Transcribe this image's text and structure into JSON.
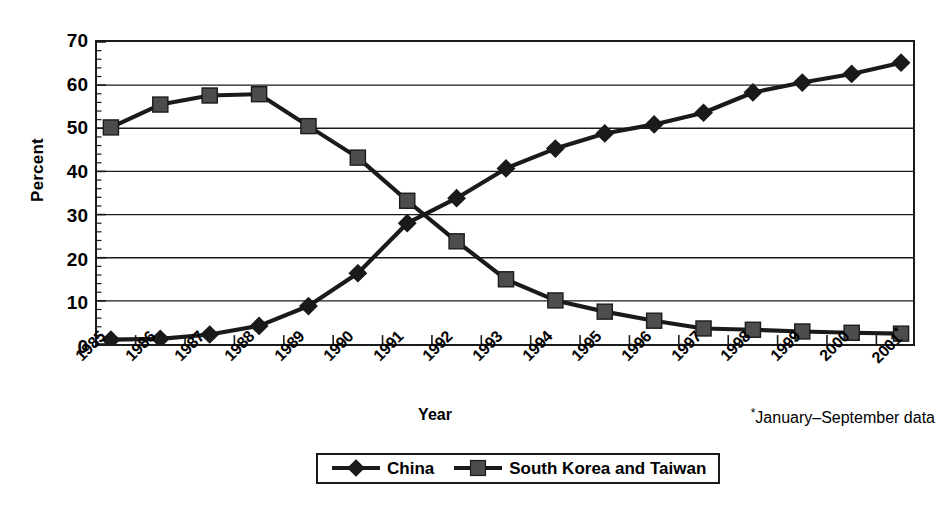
{
  "chart_data": {
    "type": "line",
    "title": "",
    "xlabel": "Year",
    "ylabel": "Percent",
    "ylim": [
      0,
      70
    ],
    "ytick_values": [
      0,
      10,
      20,
      30,
      40,
      50,
      60,
      70
    ],
    "ytick_labels": [
      "0",
      "10",
      "20",
      "30",
      "40",
      "50",
      "60",
      "70"
    ],
    "grid": "horizontal",
    "legend_position": "bottom-center",
    "categories": [
      "1985",
      "1986",
      "1987",
      "1988",
      "1989",
      "1990",
      "1991",
      "1992",
      "1993",
      "1994",
      "1995",
      "1996",
      "1997",
      "1998",
      "1999",
      "2000",
      "2001*"
    ],
    "x_tick_labels": [
      "1985",
      "1986",
      "1987",
      "1988",
      "1989",
      "1990",
      "1991",
      "1992",
      "1993",
      "1994",
      "1995",
      "1996",
      "1997",
      "1998",
      "1999",
      "2000",
      "2001*"
    ],
    "series": [
      {
        "name": "China",
        "marker": "diamond",
        "color": "#1a1a1a",
        "values": [
          1.0,
          1.2,
          2.2,
          4.2,
          8.8,
          16.4,
          28.0,
          33.8,
          40.7,
          45.3,
          48.8,
          50.9,
          53.6,
          58.3,
          60.6,
          62.6,
          65.2
        ]
      },
      {
        "name": "South Korea and Taiwan",
        "marker": "square",
        "color": "#4d4d4d",
        "values": [
          50.2,
          55.5,
          57.6,
          57.9,
          50.5,
          43.2,
          33.2,
          23.8,
          15.0,
          10.1,
          7.5,
          5.4,
          3.6,
          3.3,
          2.9,
          2.6,
          2.4
        ]
      }
    ],
    "annotations": [
      "*January–September data"
    ]
  },
  "axes": {
    "y_title": "Percent",
    "x_title": "Year"
  },
  "footnote": {
    "star": "*",
    "text": "January–September data"
  },
  "legend": {
    "entries": [
      {
        "label": "China",
        "marker": "diamond"
      },
      {
        "label": "South Korea and Taiwan",
        "marker": "square"
      }
    ]
  }
}
